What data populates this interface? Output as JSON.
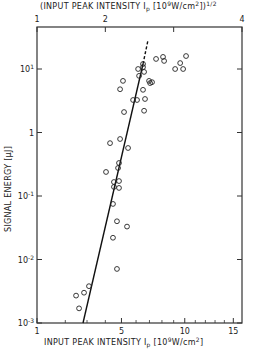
{
  "chart_data": {
    "type": "scatter",
    "title": "",
    "xlabel": "INPUT PEAK INTENSITY I_p [10^9 W/cm^2]",
    "xlabel_top": "(INPUT PEAK INTENSITY I_p [10^9 W/cm^2])^1/2",
    "ylabel": "SIGNAL ENERGY [µJ]",
    "x_scale": "sqrt",
    "y_scale": "log",
    "xlim": [
      1,
      16
    ],
    "ylim": [
      0.001,
      45
    ],
    "x_ticks_bottom": [
      1,
      5,
      10,
      15
    ],
    "x_minor_ticks_bottom": [
      2,
      3,
      4,
      6,
      7,
      8,
      9,
      11,
      12,
      13,
      14
    ],
    "x_ticks_top": [
      1,
      2,
      3,
      4
    ],
    "x_tick_labels_top": [
      "1",
      "2",
      "",
      "4"
    ],
    "y_ticks": [
      0.001,
      0.01,
      0.1,
      1,
      10
    ],
    "y_tick_labels": [
      "10^-3",
      "10^-2",
      "10^-1",
      "1",
      "10^1"
    ],
    "grid": false,
    "legend": null,
    "series": [
      {
        "name": "measured",
        "marker": "open-circle",
        "points": [
          [
            2.47,
            0.0027
          ],
          [
            2.61,
            0.0017
          ],
          [
            2.85,
            0.003
          ],
          [
            3.1,
            0.0038
          ],
          [
            4.71,
            0.0071
          ],
          [
            4.46,
            0.022
          ],
          [
            5.37,
            0.033
          ],
          [
            4.71,
            0.04
          ],
          [
            4.46,
            0.075
          ],
          [
            4.84,
            0.134
          ],
          [
            4.52,
            0.139
          ],
          [
            4.84,
            0.172
          ],
          [
            4.52,
            0.166
          ],
          [
            4.04,
            0.239
          ],
          [
            4.78,
            0.276
          ],
          [
            4.84,
            0.331
          ],
          [
            5.44,
            0.57
          ],
          [
            4.28,
            0.68
          ],
          [
            4.91,
            0.79
          ],
          [
            5.17,
            2.1
          ],
          [
            6.59,
            2.2
          ],
          [
            5.79,
            3.25
          ],
          [
            6.07,
            3.25
          ],
          [
            6.66,
            3.37
          ],
          [
            6.51,
            4.7
          ],
          [
            4.91,
            4.8
          ],
          [
            5.1,
            6.5
          ],
          [
            6.97,
            6.5
          ],
          [
            7.05,
            6.0
          ],
          [
            6.22,
            7.8
          ],
          [
            6.59,
            9.0
          ],
          [
            6.51,
            10.7
          ],
          [
            6.51,
            12.0
          ],
          [
            6.15,
            10.0
          ],
          [
            7.2,
            6.2
          ],
          [
            7.52,
            14.4
          ],
          [
            8.09,
            15.5
          ],
          [
            8.18,
            13.4
          ],
          [
            9.13,
            10.0
          ],
          [
            9.58,
            12.4
          ],
          [
            9.85,
            10.0
          ],
          [
            10.12,
            16.0
          ]
        ]
      },
      {
        "name": "fit-solid",
        "type": "line",
        "style": "solid",
        "points": [
          [
            2.8,
            0.001
          ],
          [
            6.51,
            12.0
          ]
        ]
      },
      {
        "name": "fit-dashed",
        "type": "line",
        "style": "dashed",
        "points": [
          [
            6.51,
            12.0
          ],
          [
            6.89,
            28.6
          ]
        ]
      }
    ]
  },
  "labels": {
    "top_axis_title": "(INPUT PEAK INTENSITY  I",
    "top_axis_sub": "p",
    "top_axis_rest": " [10",
    "top_axis_exp": "9",
    "top_axis_rest2": "W/cm",
    "top_axis_exp2": "2",
    "top_axis_end": "])",
    "top_axis_power": "1/2",
    "bottom_axis_title": "INPUT PEAK INTENSITY  I",
    "bottom_axis_sub": "p",
    "bottom_axis_rest": " [10",
    "bottom_axis_exp": "9",
    "bottom_axis_rest2": "W/cm",
    "bottom_axis_exp2": "2",
    "bottom_axis_end": "]",
    "y_axis_title": "SIGNAL ENERGY [µJ]"
  }
}
